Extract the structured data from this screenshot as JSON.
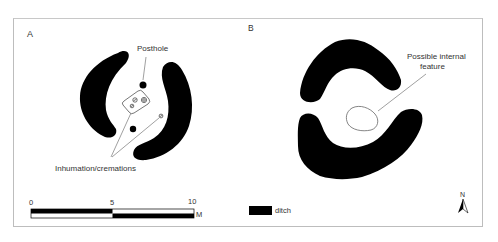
{
  "panels": [
    {
      "id": "A",
      "label": "A",
      "annotations": {
        "posthole": "Posthole",
        "burials": "Inhumation/cremations"
      }
    },
    {
      "id": "B",
      "label": "B",
      "annotations": {
        "internal_feature_line1": "Possible internal",
        "internal_feature_line2": "feature"
      }
    }
  ],
  "scale_bar": {
    "ticks": [
      "0",
      "5",
      "10"
    ],
    "unit": "M"
  },
  "legend": {
    "items": [
      {
        "label": "ditch",
        "color": "#000000"
      }
    ]
  },
  "north_arrow": {
    "label": "N"
  },
  "colors": {
    "ditch": "#000000",
    "frame": "#bdbdbd",
    "leader_line": "#777777"
  }
}
